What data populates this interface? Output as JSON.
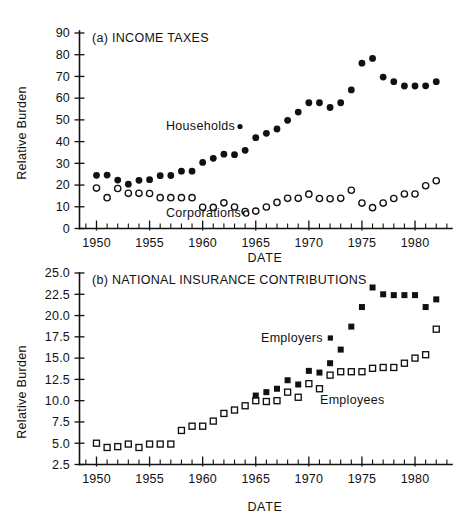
{
  "figure": {
    "background": "#ffffff",
    "ink_color": "#111111"
  },
  "chart_data": [
    {
      "id": "panel-a",
      "type": "scatter",
      "title": "(a) INCOME TAXES",
      "xlabel": "DATE",
      "ylabel": "Relative Burden",
      "xlim": [
        1948.4,
        1983.2
      ],
      "ylim": [
        0,
        90
      ],
      "xticks": [
        1950,
        1955,
        1960,
        1965,
        1970,
        1975,
        1980
      ],
      "xticklabels": [
        "1950",
        "1955",
        "1960",
        "1965",
        "1970",
        "1975",
        "1980"
      ],
      "xtick_minor_step": 1,
      "yticks": [
        0,
        10,
        20,
        30,
        40,
        50,
        60,
        70,
        80,
        90
      ],
      "yticklabels": [
        "0",
        "10",
        "20",
        "30",
        "40",
        "50",
        "60",
        "70",
        "80",
        "90"
      ],
      "grid": false,
      "legend_position": "inline-annotation",
      "x": [
        1950,
        1951,
        1952,
        1953,
        1954,
        1955,
        1956,
        1957,
        1958,
        1959,
        1960,
        1961,
        1962,
        1963,
        1964,
        1965,
        1966,
        1967,
        1968,
        1969,
        1970,
        1971,
        1972,
        1973,
        1974,
        1975,
        1976,
        1977,
        1978,
        1979,
        1980,
        1981,
        1982
      ],
      "series": [
        {
          "name": "Households",
          "marker": "filled-circle",
          "values": [
            24.5,
            24.6,
            22.3,
            20.4,
            22.2,
            22.5,
            24.3,
            24.4,
            26.4,
            26.4,
            30.4,
            32.3,
            34.2,
            34.0,
            36.0,
            41.8,
            43.8,
            45.8,
            49.8,
            53.6,
            57.9,
            57.9,
            55.7,
            57.9,
            63.8,
            76.1,
            78.3,
            69.7,
            67.6,
            65.6,
            65.6,
            65.7,
            67.6
          ]
        },
        {
          "name": "Corporations",
          "marker": "open-circle",
          "values": [
            18.6,
            14.2,
            18.4,
            16.2,
            16.2,
            16.1,
            14.2,
            14.2,
            14.2,
            14.2,
            9.8,
            9.7,
            11.8,
            9.9,
            7.8,
            8.0,
            9.9,
            12.0,
            13.9,
            13.9,
            15.8,
            13.8,
            13.7,
            13.9,
            17.6,
            11.7,
            9.6,
            11.7,
            13.8,
            15.9,
            15.9,
            19.7,
            22.0
          ]
        }
      ]
    },
    {
      "id": "panel-b",
      "type": "scatter",
      "title": "(b) NATIONAL INSURANCE CONTRIBUTIONS",
      "xlabel": "DATE",
      "ylabel": "Relative Burden",
      "xlim": [
        1948.4,
        1983.2
      ],
      "ylim": [
        2.5,
        25.0
      ],
      "xticks": [
        1950,
        1955,
        1960,
        1965,
        1970,
        1975,
        1980
      ],
      "xticklabels": [
        "1950",
        "1955",
        "1960",
        "1965",
        "1970",
        "1975",
        "1980"
      ],
      "xtick_minor_step": 1,
      "yticks": [
        2.5,
        5.0,
        7.5,
        10.0,
        12.5,
        15.0,
        17.5,
        20.0,
        22.5,
        25.0
      ],
      "yticklabels": [
        "2.5",
        "5.0",
        "7.5",
        "10.0",
        "12.5",
        "15.0",
        "17.5",
        "20.0",
        "22.5",
        "25.0"
      ],
      "grid": false,
      "legend_position": "inline-annotation",
      "x": [
        1950,
        1951,
        1952,
        1953,
        1954,
        1955,
        1956,
        1957,
        1958,
        1959,
        1960,
        1961,
        1962,
        1963,
        1964,
        1965,
        1966,
        1967,
        1968,
        1969,
        1970,
        1971,
        1972,
        1973,
        1974,
        1975,
        1976,
        1977,
        1978,
        1979,
        1980,
        1981,
        1982
      ],
      "series": [
        {
          "name": "Employers",
          "marker": "filled-square",
          "values": [
            null,
            null,
            null,
            null,
            null,
            null,
            null,
            null,
            null,
            null,
            null,
            null,
            null,
            null,
            null,
            10.6,
            11.0,
            11.4,
            12.4,
            11.9,
            13.5,
            13.3,
            14.4,
            16.0,
            18.7,
            21.0,
            23.3,
            22.5,
            22.4,
            22.4,
            22.4,
            21.0,
            21.9
          ]
        },
        {
          "name": "Employees",
          "marker": "open-square",
          "values": [
            5.0,
            4.5,
            4.6,
            4.9,
            4.5,
            4.9,
            4.9,
            4.9,
            6.5,
            7.0,
            7.0,
            7.6,
            8.5,
            8.9,
            9.4,
            10.0,
            9.9,
            10.0,
            11.0,
            10.4,
            12.0,
            11.4,
            13.0,
            13.4,
            13.4,
            13.4,
            13.8,
            13.9,
            13.9,
            14.4,
            15.0,
            15.4,
            18.4
          ]
        }
      ]
    }
  ]
}
